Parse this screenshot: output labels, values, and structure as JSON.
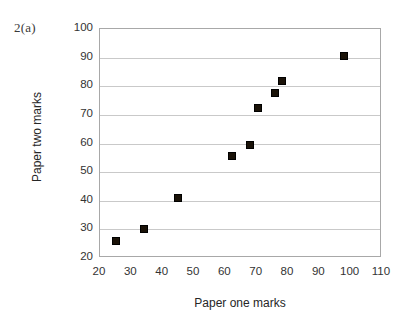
{
  "figure": {
    "question_label": "2(a)"
  },
  "chart_data": {
    "type": "scatter",
    "title": "",
    "xlabel": "Paper one marks",
    "ylabel": "Paper two marks",
    "xlim": [
      20,
      110
    ],
    "ylim": [
      20,
      100
    ],
    "xticks": [
      20,
      30,
      40,
      50,
      60,
      70,
      80,
      90,
      100,
      110
    ],
    "yticks": [
      20,
      30,
      40,
      50,
      60,
      70,
      80,
      90,
      100
    ],
    "xtick_labels": [
      "20",
      "30",
      "40",
      "50",
      "60",
      "70",
      "80",
      "90",
      "100",
      "110"
    ],
    "ytick_labels": [
      "20",
      "30",
      "40",
      "50",
      "60",
      "70",
      "80",
      "90",
      "100"
    ],
    "grid": "horizontal",
    "legend": "none",
    "marker_style": "filled-square",
    "marker_color": "#1a1208",
    "series": [
      {
        "name": "Paper marks",
        "points": [
          {
            "x": 25,
            "y": 26
          },
          {
            "x": 34,
            "y": 30
          },
          {
            "x": 45,
            "y": 41
          },
          {
            "x": 62,
            "y": 55.5
          },
          {
            "x": 68,
            "y": 59.5
          },
          {
            "x": 70.5,
            "y": 72.5
          },
          {
            "x": 76,
            "y": 77.5
          },
          {
            "x": 78,
            "y": 82
          },
          {
            "x": 98,
            "y": 90.5
          }
        ]
      }
    ]
  }
}
